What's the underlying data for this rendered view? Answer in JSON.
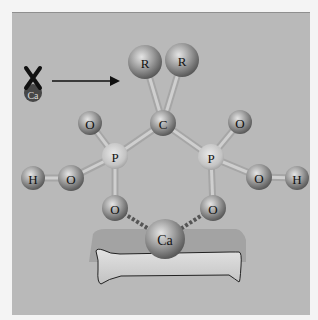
{
  "diagram": {
    "atoms": [
      {
        "id": "R1",
        "label": "R",
        "x": 145,
        "y": 62,
        "r": 17
      },
      {
        "id": "R2",
        "label": "R",
        "x": 182,
        "y": 60,
        "r": 17
      },
      {
        "id": "C",
        "label": "C",
        "x": 163,
        "y": 123,
        "r": 13
      },
      {
        "id": "O_top_left",
        "label": "O",
        "x": 90,
        "y": 123,
        "r": 12
      },
      {
        "id": "O_top_right",
        "label": "O",
        "x": 240,
        "y": 122,
        "r": 12
      },
      {
        "id": "P_left",
        "label": "P",
        "x": 115,
        "y": 156,
        "r": 13
      },
      {
        "id": "P_right",
        "label": "P",
        "x": 211,
        "y": 157,
        "r": 13
      },
      {
        "id": "O_mid_left",
        "label": "O",
        "x": 71,
        "y": 178,
        "r": 13
      },
      {
        "id": "H_left",
        "label": "H",
        "x": 33,
        "y": 178,
        "r": 12
      },
      {
        "id": "O_mid_right",
        "label": "O",
        "x": 259,
        "y": 177,
        "r": 13
      },
      {
        "id": "H_right",
        "label": "H",
        "x": 297,
        "y": 178,
        "r": 12
      },
      {
        "id": "O_bot_left",
        "label": "O",
        "x": 115,
        "y": 208,
        "r": 13
      },
      {
        "id": "O_bot_right",
        "label": "O",
        "x": 213,
        "y": 208,
        "r": 13
      },
      {
        "id": "Ca",
        "label": "Ca",
        "x": 165,
        "y": 239,
        "r": 20
      }
    ],
    "bonds": [
      [
        "R1",
        "C"
      ],
      [
        "R2",
        "C"
      ],
      [
        "C",
        "P_left"
      ],
      [
        "C",
        "P_right"
      ],
      [
        "P_left",
        "O_top_left"
      ],
      [
        "P_left",
        "O_mid_left"
      ],
      [
        "O_mid_left",
        "H_left"
      ],
      [
        "P_left",
        "O_bot_left"
      ],
      [
        "P_right",
        "O_top_right"
      ],
      [
        "P_right",
        "O_mid_right"
      ],
      [
        "O_mid_right",
        "H_right"
      ],
      [
        "P_right",
        "O_bot_right"
      ]
    ],
    "ionic_bonds": [
      [
        "O_bot_left",
        "Ca"
      ],
      [
        "O_bot_right",
        "Ca"
      ]
    ],
    "blocked_ca": {
      "label": "Ca",
      "x": 33,
      "y": 93
    },
    "arrow": {
      "from_x": 52,
      "to_x": 120,
      "y": 81
    }
  }
}
